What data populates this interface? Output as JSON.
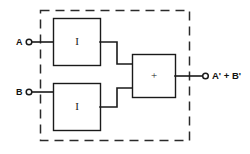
{
  "figure": {
    "background_color": "#ffffff",
    "line_color": "#1a1a1a"
  },
  "inputs": [
    {
      "label": "A",
      "terminal": "open-circle-terminal"
    },
    {
      "label": "B",
      "terminal": "open-circle-terminal"
    }
  ],
  "gates": [
    {
      "id": "inverter-top",
      "glyph": "I",
      "function": "inverter"
    },
    {
      "id": "inverter-bottom",
      "glyph": "I",
      "function": "inverter"
    },
    {
      "id": "or-gate",
      "glyph": "+",
      "function": "or"
    }
  ],
  "output": {
    "label": "A' + B'",
    "terminal": "open-circle-terminal"
  },
  "boundary": {
    "style": "dashed",
    "name": "module-boundary"
  }
}
